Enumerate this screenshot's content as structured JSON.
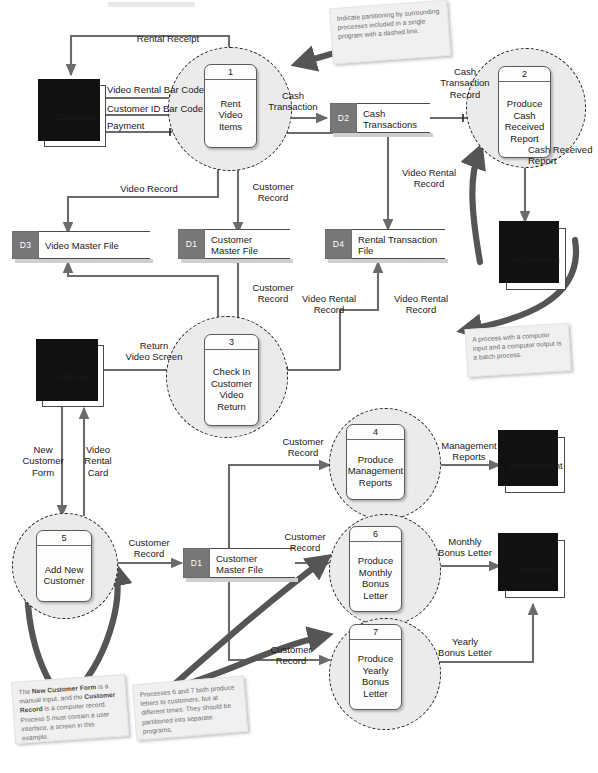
{
  "diagram": {
    "entities": [
      {
        "id": "customer-top",
        "label": "Customer"
      },
      {
        "id": "customer-mid",
        "label": "Customer"
      },
      {
        "id": "accounting",
        "label": "Accounting"
      },
      {
        "id": "management",
        "label": "Management"
      },
      {
        "id": "customer-bottom",
        "label": "Customer"
      }
    ],
    "processes": [
      {
        "num": "1",
        "lines": [
          "Rent",
          "Video",
          "Items"
        ]
      },
      {
        "num": "2",
        "lines": [
          "Produce",
          "Cash",
          "Received",
          "Report"
        ]
      },
      {
        "num": "3",
        "lines": [
          "Check In",
          "Customer",
          "Video",
          "Return"
        ]
      },
      {
        "num": "4",
        "lines": [
          "Produce",
          "Management",
          "Reports"
        ]
      },
      {
        "num": "5",
        "lines": [
          "Add New",
          "Customer"
        ]
      },
      {
        "num": "6",
        "lines": [
          "Produce",
          "Monthly",
          "Bonus",
          "Letter"
        ]
      },
      {
        "num": "7",
        "lines": [
          "Produce",
          "Yearly",
          "Bonus",
          "Letter"
        ]
      }
    ],
    "stores": [
      {
        "id": "D2",
        "lines": [
          "Cash",
          "Transactions"
        ]
      },
      {
        "id": "D3",
        "lines": [
          "Video Master File"
        ]
      },
      {
        "id": "D1",
        "lines": [
          "Customer",
          "Master File"
        ]
      },
      {
        "id": "D4",
        "lines": [
          "Rental Transaction",
          "File"
        ]
      },
      {
        "id": "D1",
        "lines": [
          "Customer",
          "Master File"
        ]
      }
    ],
    "flows": [
      {
        "id": "rental-receipt",
        "label": "Rental Receipt"
      },
      {
        "id": "video-rental-bar-code",
        "label": "Video Rental Bar Code"
      },
      {
        "id": "customer-id-bar-code",
        "label": "Customer ID Bar Code"
      },
      {
        "id": "payment",
        "label": "Payment"
      },
      {
        "id": "cash-transaction",
        "label": "Cash\nTransaction"
      },
      {
        "id": "cash-transaction-record",
        "label": "Cash\nTransaction\nRecord"
      },
      {
        "id": "cash-received-report",
        "label": "Cash Received\nReport"
      },
      {
        "id": "video-record-1",
        "label": "Video Record"
      },
      {
        "id": "customer-record-1",
        "label": "Customer\nRecord"
      },
      {
        "id": "video-rental-record-1",
        "label": "Video Rental\nRecord"
      },
      {
        "id": "customer-record-2",
        "label": "Customer\nRecord"
      },
      {
        "id": "video-rental-record-2",
        "label": "Video Rental\nRecord"
      },
      {
        "id": "video-rental-record-3",
        "label": "Video Rental\nRecord"
      },
      {
        "id": "return-video-screen",
        "label": "Return\nVideo Screen"
      },
      {
        "id": "new-customer-form",
        "label": "New\nCustomer\nForm"
      },
      {
        "id": "video-rental-card",
        "label": "Video\nRental\nCard"
      },
      {
        "id": "customer-record-3",
        "label": "Customer\nRecord"
      },
      {
        "id": "customer-record-4",
        "label": "Customer\nRecord"
      },
      {
        "id": "customer-record-5",
        "label": "Customer\nRecord"
      },
      {
        "id": "customer-record-6",
        "label": "Customer\nRecord"
      },
      {
        "id": "management-reports",
        "label": "Management\nReports"
      },
      {
        "id": "monthly-bonus-letter",
        "label": "Monthly\nBonus Letter"
      },
      {
        "id": "yearly-bonus-letter",
        "label": "Yearly\nBonus Letter"
      }
    ],
    "notes": [
      {
        "id": "note-partitioning",
        "text": "Indicate partitioning by surrounding processes included in a single program with a dashed line."
      },
      {
        "id": "note-batch-process",
        "text": "A process with a computer input and a computer output is a batch process."
      },
      {
        "id": "note-new-customer-form",
        "pre": "The ",
        "b1": "New Customer Form",
        "mid": " is a manual input, and the ",
        "b2": "Customer Record",
        "post": " is a computer record. Process 5 must contain a user interface, a screen in this example."
      },
      {
        "id": "note-processes-6-7",
        "text": "Processes 6 and 7 both produce letters to customers, but at different times. They should be partitioned into separate programs."
      }
    ],
    "colors": {
      "bubble_fill": "#ebebeb",
      "store_id_fill": "#777777",
      "flow_line": "#6b6b6b",
      "note_fill": "#f0f0f0",
      "entity_shadow": "#111111"
    }
  }
}
